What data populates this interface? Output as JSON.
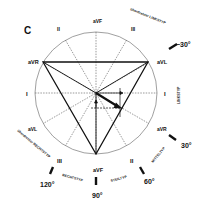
{
  "panel_label": "C",
  "leads": {
    "aVR": "aVR",
    "aVL": "aVL",
    "aVF": "aVF",
    "I_left": "I",
    "I_right": "I",
    "II_top": "II",
    "II_bottom": "II",
    "III_top": "III",
    "III_bottom": "III",
    "aVL_bottom": "aVL",
    "aVR_bottom": "aVR",
    "aVF_top": "aVF"
  },
  "angles": {
    "minus30": "−30°",
    "plus30": "30°",
    "plus60": "60°",
    "plus90": "90°",
    "plus120": "120°"
  },
  "types": {
    "ueberdrehter_linkstyp": "überdrehter LINKSTYP",
    "linkstyp": "LINKSTYP",
    "mitteltyp": "MITTELTYP",
    "steiltyp": "STEILTYP",
    "rechtstyp": "RECHTSTYP",
    "ueberdrehter_rechtstyp": "überdrehter RECHTSTYP"
  },
  "colors": {
    "line": "#111111",
    "circle": "#777777"
  }
}
